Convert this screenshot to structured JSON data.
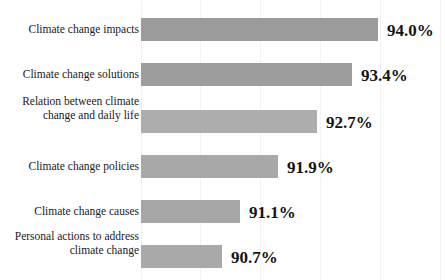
{
  "chart_data": {
    "type": "bar",
    "orientation": "horizontal",
    "title": "",
    "xlabel": "",
    "ylabel": "",
    "xlim": [
      0,
      100
    ],
    "grid": true,
    "legend": "none",
    "categories": [
      "Climate change impacts",
      "Climate change solutions",
      "Relation  between climate\nchange and daily life",
      "Climate change policies",
      "Climate change causes",
      "Personal actions to address\nclimate change"
    ],
    "values": [
      94.0,
      93.4,
      92.7,
      91.9,
      91.1,
      90.7
    ],
    "value_labels": [
      "94.0%",
      "93.4%",
      "92.7%",
      "91.9%",
      "91.1%",
      "90.7%"
    ],
    "bar_colors": [
      "#9b9b9b",
      "#9d9d9d",
      "#adadad",
      "#a8a8a8",
      "#a6a6a6",
      "#a9a9a9"
    ],
    "bars": [
      {
        "label": "Climate change impacts",
        "value": 94.0,
        "value_label": "94.0%",
        "top": 18,
        "width": 237,
        "color": "#9b9b9b"
      },
      {
        "label": "Climate change solutions",
        "value": 93.4,
        "value_label": "93.4%",
        "top": 63,
        "width": 211,
        "color": "#9d9d9d"
      },
      {
        "label": "Relation  between climate\nchange and daily life",
        "value": 92.7,
        "value_label": "92.7%",
        "top": 110,
        "width": 176,
        "color": "#adadad"
      },
      {
        "label": "Climate change policies",
        "value": 91.9,
        "value_label": "91.9%",
        "top": 155,
        "width": 137,
        "color": "#a8a8a8"
      },
      {
        "label": "Climate change causes",
        "value": 91.1,
        "value_label": "91.1%",
        "top": 200,
        "width": 99,
        "color": "#a6a6a6"
      },
      {
        "label": "Personal actions to address\nclimate change",
        "value": 90.7,
        "value_label": "90.7%",
        "top": 245,
        "width": 81,
        "color": "#a9a9a9"
      }
    ]
  },
  "gridlines_x": [
    141,
    200,
    260,
    320,
    380,
    440
  ]
}
